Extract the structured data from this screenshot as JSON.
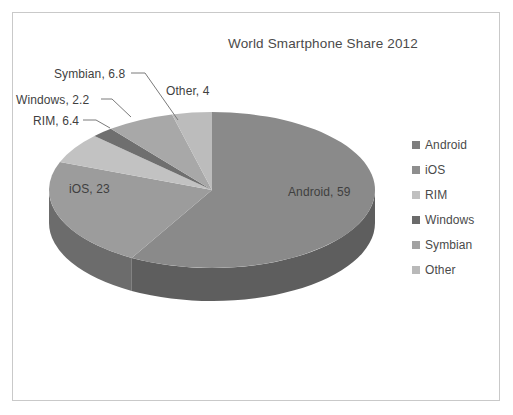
{
  "frame": {
    "border_color": "#c9c9c9",
    "background": "#ffffff"
  },
  "chart_data": {
    "type": "pie",
    "title": "World Smartphone Share 2012",
    "xlabel": "",
    "ylabel": "",
    "three_d": true,
    "legend_position": "right",
    "grid": false,
    "categories": [
      "Android",
      "iOS",
      "RIM",
      "Windows",
      "Symbian",
      "Other"
    ],
    "values": [
      59,
      23,
      6.4,
      2.2,
      6.8,
      4
    ],
    "slice_colors": [
      "#8a8a8a",
      "#9c9c9c",
      "#c2c2c2",
      "#6f6f6f",
      "#a8a8a8",
      "#bcbcbc"
    ],
    "side_colors": [
      "#5e5e5e",
      "#6c6c6c",
      "#8c8c8c",
      "#4d4d4d",
      "#757575",
      "#868686"
    ],
    "data_labels": [
      {
        "key": "android",
        "text": "Android, 59"
      },
      {
        "key": "ios",
        "text": "iOS, 23"
      },
      {
        "key": "rim",
        "text": "RIM, 6.4"
      },
      {
        "key": "windows",
        "text": "Windows, 2.2"
      },
      {
        "key": "symbian",
        "text": "Symbian, 6.8"
      },
      {
        "key": "other",
        "text": "Other, 4"
      }
    ]
  },
  "title": {
    "text": "World Smartphone Share 2012"
  },
  "labels": {
    "android": "Android, 59",
    "ios": "iOS, 23",
    "rim": "RIM, 6.4",
    "windows": "Windows, 2.2",
    "symbian": "Symbian, 6.8",
    "other": "Other, 4"
  },
  "legend": {
    "items": [
      {
        "label": "Android",
        "color": "#7e7e7e"
      },
      {
        "label": "iOS",
        "color": "#8e8e8e"
      },
      {
        "label": "RIM",
        "color": "#c0c0c0"
      },
      {
        "label": "Windows",
        "color": "#6b6b6b"
      },
      {
        "label": "Symbian",
        "color": "#a2a2a2"
      },
      {
        "label": "Other",
        "color": "#b9b9b9"
      }
    ]
  }
}
